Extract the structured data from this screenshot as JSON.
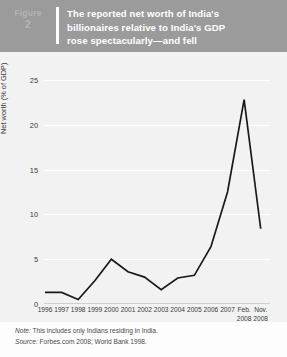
{
  "header": {
    "figure_word": "Figure",
    "figure_number": "2",
    "title_lines": [
      "The reported net worth of India's",
      "billionaires relative to India's GDP",
      "rose spectacularly—and fell"
    ],
    "band_color": "#9b9b9b",
    "title_color": "#ffffff",
    "figure_tag_color": "#b4b4b4"
  },
  "footer": {
    "note_label": "Note:",
    "note_text": "This includes only Indians residing in India.",
    "source_label": "Source:",
    "source_text": "Forbes.com 2008; World Bank 1998."
  },
  "chart_data": {
    "type": "line",
    "title": "The reported net worth of India's billionaires relative to India's GDP rose spectacularly—and fell",
    "xlabel": "",
    "ylabel": "Net worth (% of GDP)",
    "categories": [
      "1996",
      "1997",
      "1998",
      "1999",
      "2000",
      "2001",
      "2002",
      "2003",
      "2004",
      "2005",
      "2006",
      "2007",
      "Feb. 2008",
      "Nov. 2008"
    ],
    "category_lines": [
      [
        "1996"
      ],
      [
        "1997"
      ],
      [
        "1998"
      ],
      [
        "1999"
      ],
      [
        "2000"
      ],
      [
        "2001"
      ],
      [
        "2002"
      ],
      [
        "2003"
      ],
      [
        "2004"
      ],
      [
        "2005"
      ],
      [
        "2006"
      ],
      [
        "2007"
      ],
      [
        "Feb.",
        "2008"
      ],
      [
        "Nov.",
        "2008"
      ]
    ],
    "values": [
      1.3,
      1.3,
      0.5,
      2.6,
      5.0,
      3.6,
      3.0,
      1.6,
      2.9,
      3.2,
      6.4,
      12.5,
      22.8,
      8.4
    ],
    "yticks": [
      0,
      5,
      10,
      15,
      20,
      25
    ],
    "ytick_labels": [
      "0",
      "5",
      "10",
      "15",
      "20",
      "25"
    ],
    "ylim": [
      0,
      25
    ],
    "grid": true,
    "legend": "none",
    "line_color": "#1a1a1a",
    "grid_color": "#ffffff",
    "plot_background": "#f2f2f2"
  }
}
